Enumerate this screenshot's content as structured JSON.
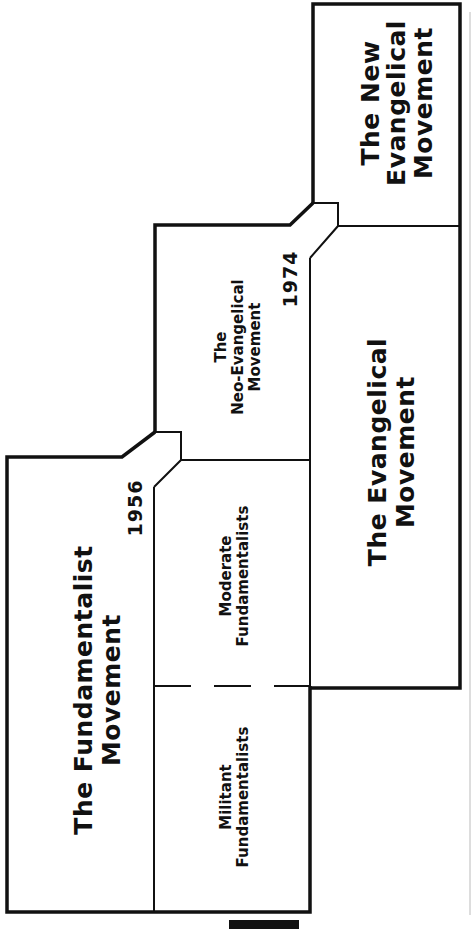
{
  "diagram": {
    "title": "",
    "colors": {
      "line": "#111111",
      "background": "#ffffff",
      "text": "#111111"
    },
    "regions": {
      "fundamentalist": {
        "label_line1": "The Fundamentalist",
        "label_line2": "Movement"
      },
      "militant": {
        "label_line1": "Militant",
        "label_line2": "Fundamentalists"
      },
      "moderate": {
        "label_line1": "Moderate",
        "label_line2": "Fundamentalists"
      },
      "neo_evangelical": {
        "label_line1": "The",
        "label_line2": "Neo-Evangelical",
        "label_line3": "Movement"
      },
      "evangelical": {
        "label_line1": "The Evangelical",
        "label_line2": "Movement"
      },
      "new_evangelical": {
        "label_line1": "The New",
        "label_line2": "Evangelical",
        "label_line3": "Movement"
      }
    },
    "years": {
      "first": "1956",
      "second": "1974"
    }
  }
}
